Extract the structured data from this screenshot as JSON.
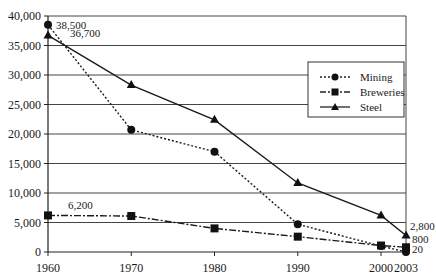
{
  "chart_data": {
    "type": "line",
    "title": "",
    "xlabel": "",
    "ylabel": "",
    "x": [
      1960,
      1970,
      1980,
      1990,
      2000,
      2003
    ],
    "x_tick_labels": [
      "1960",
      "1970",
      "1980",
      "1990",
      "2000",
      "2003"
    ],
    "ylim": [
      0,
      40000
    ],
    "y_ticks": [
      0,
      5000,
      10000,
      15000,
      20000,
      25000,
      30000,
      35000,
      40000
    ],
    "y_tick_labels": [
      "0",
      "5,000",
      "10,000",
      "15,000",
      "20,000",
      "25,000",
      "30,000",
      "35,000",
      "40,000"
    ],
    "grid": "horizontal",
    "legend_position": "upper right (inside plot)",
    "series": [
      {
        "name": "Mining",
        "line_style": "dotted",
        "marker": "circle",
        "values": [
          38500,
          20700,
          17000,
          4700,
          1000,
          20
        ]
      },
      {
        "name": "Breweries",
        "line_style": "dash-dot",
        "marker": "square",
        "values": [
          6200,
          6100,
          4000,
          2600,
          1100,
          800
        ]
      },
      {
        "name": "Steel",
        "line_style": "solid",
        "marker": "triangle",
        "values": [
          36700,
          28300,
          22400,
          11700,
          6200,
          2800
        ]
      }
    ],
    "annotations": [
      {
        "text": "38,500",
        "series": "Mining",
        "x": 1960
      },
      {
        "text": "36,700",
        "series": "Steel",
        "x": 1960
      },
      {
        "text": "6,200",
        "series": "Breweries",
        "x": 1960
      },
      {
        "text": "2,800",
        "series": "Steel",
        "x": 2003
      },
      {
        "text": "800",
        "series": "Breweries",
        "x": 2003
      },
      {
        "text": "20",
        "series": "Mining",
        "x": 2003
      }
    ]
  },
  "legend": {
    "items": [
      {
        "label": "Mining"
      },
      {
        "label": "Breweries"
      },
      {
        "label": "Steel"
      }
    ]
  }
}
